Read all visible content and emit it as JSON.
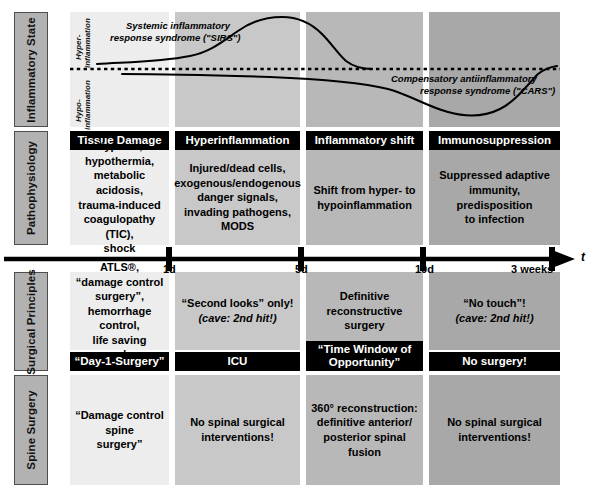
{
  "figure": {
    "type": "clinical-timeline-diagram",
    "row_labels": [
      "Inflammatory State",
      "Pathophysiology",
      "Surgical Principles",
      "Spine Surgery"
    ],
    "phase_headers": [
      "Tissue Damage",
      "Hyperinflammation",
      "Inflammatory shift",
      "Immunosuppression"
    ],
    "phase_colors": [
      "#ededed",
      "#c8c8c8",
      "#b8b8b8",
      "#a8a8a8"
    ]
  },
  "chart_data": {
    "type": "line",
    "title": "",
    "xlabel": "t",
    "ylabel": "",
    "axis_labels": {
      "upper": "Hyper-\ninflammation",
      "upper_line1": "Hyper-",
      "upper_line2": "inflammation",
      "lower_line1": "Hypo-",
      "lower_line2": "inflammation"
    },
    "baseline": "dotted zero line (normal inflammatory state)",
    "series": [
      {
        "name": "Systemic inflammatory response syndrome (\"SIRS\")",
        "label_line1": "Systemic inflammatory",
        "label_line2": "response syndrome (\"SIRS\")",
        "region": "above baseline",
        "x": [
          0,
          8,
          20,
          30,
          38,
          45,
          52,
          58,
          64,
          70,
          76,
          82,
          88,
          94,
          100
        ],
        "y": [
          5,
          7,
          9,
          12,
          22,
          48,
          78,
          95,
          99,
          92,
          68,
          34,
          12,
          4,
          2
        ],
        "description": "rises to peak during hyperinflammation then falls back to baseline by inflammatory shift"
      },
      {
        "name": "Compensatory antiinflammatory response syndrome (\"CARS\")",
        "label_line1": "Compensatory antiinflammatory",
        "label_line2": "response syndrome (\"CARS\")",
        "region": "below baseline",
        "x": [
          4,
          14,
          26,
          38,
          48,
          56,
          64,
          72,
          80,
          86,
          92,
          97,
          100
        ],
        "y": [
          -4,
          -6,
          -8,
          -10,
          -12,
          -16,
          -26,
          -44,
          -62,
          -72,
          -68,
          -40,
          -6
        ],
        "description": "slow decline below baseline, trough within immunosuppression phase, then recovery"
      }
    ],
    "ylim": [
      -100,
      100
    ],
    "grid": false,
    "legend": "inline curve annotations"
  },
  "timeline": {
    "axis_symbol": "t",
    "ticks": [
      {
        "label": "1d",
        "x_pct": 21.5
      },
      {
        "label": "5d",
        "x_pct": 48.0
      },
      {
        "label": "10d",
        "x_pct": 72.5
      },
      {
        "label": "3 weeks",
        "x_pct": 96.0
      }
    ]
  },
  "rows": {
    "pathophysiology": [
      "Hypoxia,\nhypothermia,\nmetabolic acidosis,\ntrauma-induced\ncoagulopathy (TIC),\nshock",
      "Injured/dead cells,\nexogenous/endogenous\ndanger signals,\ninvading pathogens,\nMODS",
      "Shift from hyper- to\nhypoinflammation",
      "Suppressed adaptive\nimmunity,\npredisposition\nto infection"
    ],
    "surgical_principles": [
      {
        "text": "ATLS®,\n“damage control surgery”,\nhemorrhage control,\nlife saving procedures",
        "italic_tail": ""
      },
      {
        "text": "“Second looks” only!",
        "italic_tail": "(cave: 2nd hit!)"
      },
      {
        "text": "Definitive\nreconstructive\nsurgery",
        "italic_tail": ""
      },
      {
        "text": "“No touch”!",
        "italic_tail": "(cave: 2nd hit!)"
      }
    ],
    "surgical_banners": [
      "“Day-1-Surgery”",
      "ICU",
      "“Time Window of\nOpportunity”",
      "No surgery!"
    ],
    "spine_surgery": [
      "“Damage control spine\nsurgery”",
      "No spinal surgical\ninterventions!",
      "360° reconstruction:\ndefinitive anterior/\nposterior spinal fusion",
      "No spinal surgical\ninterventions!"
    ]
  }
}
